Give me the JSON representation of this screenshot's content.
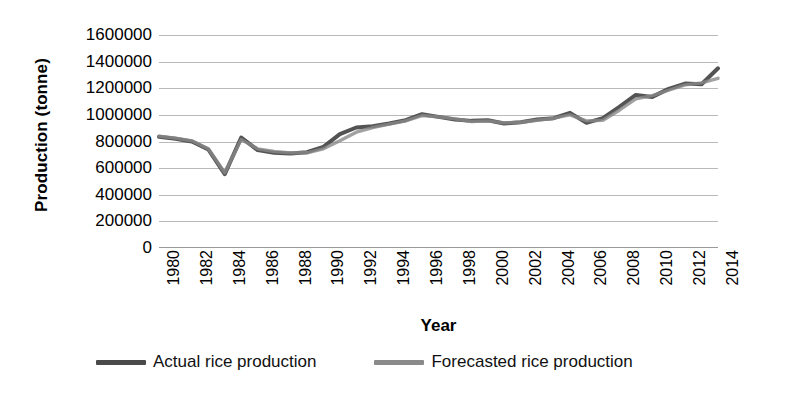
{
  "chart_data": {
    "type": "line",
    "title": "",
    "xlabel": "Year",
    "ylabel": "Production (tonne)",
    "xlim": [
      1980,
      2014
    ],
    "ylim": [
      0,
      1600000
    ],
    "grid": true,
    "legend_position": "bottom",
    "y_ticks": [
      1600000,
      1400000,
      1200000,
      1000000,
      800000,
      600000,
      400000,
      200000,
      0
    ],
    "y_tick_labels": [
      "1600000",
      "1400000",
      "1200000",
      "1000000",
      "800000",
      "600000",
      "400000",
      "200000",
      "0"
    ],
    "x_tick_labels": [
      "1980",
      "1982",
      "1984",
      "1986",
      "1988",
      "1990",
      "1992",
      "1994",
      "1996",
      "1998",
      "2000",
      "2002",
      "2004",
      "2006",
      "2008",
      "2010",
      "2012",
      "2014"
    ],
    "x": [
      1980,
      1981,
      1982,
      1983,
      1984,
      1985,
      1986,
      1987,
      1988,
      1989,
      1990,
      1991,
      1992,
      1993,
      1994,
      1995,
      1996,
      1997,
      1998,
      1999,
      2000,
      2001,
      2002,
      2003,
      2004,
      2005,
      2006,
      2007,
      2008,
      2009,
      2010,
      2011,
      2012,
      2013,
      2014
    ],
    "series": [
      {
        "name": "Actual rice production",
        "color": "#4a4a4a",
        "values": [
          835000,
          820000,
          800000,
          740000,
          555000,
          830000,
          735000,
          715000,
          710000,
          720000,
          760000,
          855000,
          905000,
          915000,
          935000,
          960000,
          1005000,
          985000,
          965000,
          955000,
          960000,
          935000,
          945000,
          965000,
          975000,
          1015000,
          940000,
          975000,
          1060000,
          1150000,
          1135000,
          1195000,
          1235000,
          1230000,
          1350000
        ]
      },
      {
        "name": "Forecasted rice production",
        "color": "#8a8a8a",
        "values": [
          840000,
          825000,
          805000,
          745000,
          565000,
          815000,
          745000,
          725000,
          715000,
          715000,
          745000,
          805000,
          870000,
          905000,
          930000,
          955000,
          995000,
          985000,
          970000,
          950000,
          955000,
          940000,
          945000,
          960000,
          975000,
          1000000,
          955000,
          960000,
          1035000,
          1120000,
          1145000,
          1185000,
          1225000,
          1240000,
          1275000
        ]
      }
    ]
  },
  "legend": {
    "items": [
      {
        "label": "Actual rice production",
        "color": "#4a4a4a"
      },
      {
        "label": "Forecasted rice production",
        "color": "#8a8a8a"
      }
    ]
  }
}
